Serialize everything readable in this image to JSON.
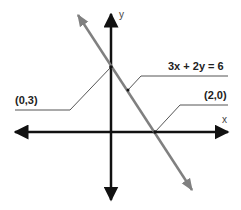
{
  "diagram": {
    "axes": {
      "x_label": "x",
      "y_label": "y"
    },
    "equation_label": "3x + 2y = 6",
    "points": [
      {
        "label": "(0,3)",
        "x": 0,
        "y": 3,
        "type": "y-intercept"
      },
      {
        "label": "(2,0)",
        "x": 2,
        "y": 0,
        "type": "x-intercept"
      }
    ],
    "colors": {
      "axes": "#111111",
      "line": "#808080",
      "leaders": "#555555",
      "text": "#222222"
    }
  }
}
